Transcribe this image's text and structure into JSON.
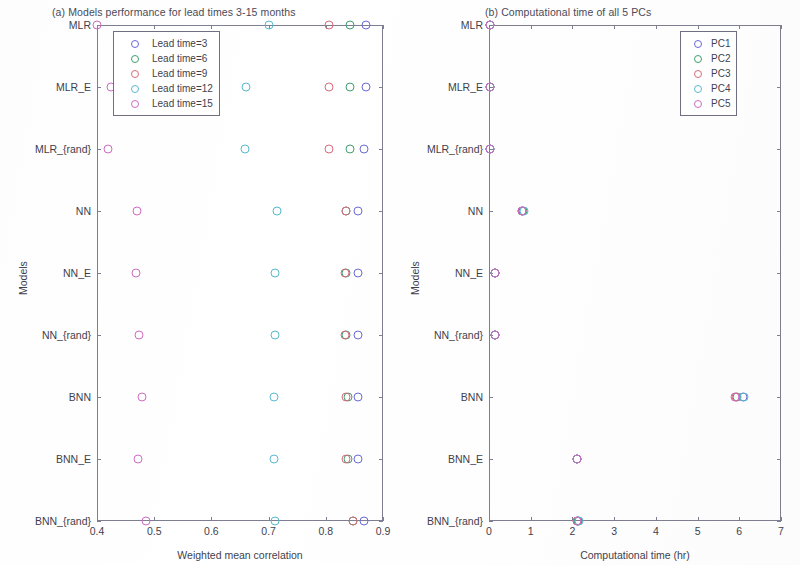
{
  "figure": {
    "models": [
      "MLR",
      "MLR_E",
      "MLR_{rand}",
      "NN",
      "NN_E",
      "NN_{rand}",
      "BNN",
      "BNN_E",
      "BNN_{rand}"
    ],
    "series_colors": [
      "#6a6ad8",
      "#3f9f6f",
      "#d86a7a",
      "#58b9cf",
      "#cf6ac4"
    ]
  },
  "panel_a": {
    "title": "(a) Models performance for lead times 3-15 months",
    "xlabel": "Weighted mean correlation",
    "ylabel": "Models",
    "xticks": [
      "0.4",
      "0.5",
      "0.6",
      "0.7",
      "0.8",
      "0.9"
    ],
    "legend": [
      {
        "label": "Lead time=3",
        "color": "#6a6ad8"
      },
      {
        "label": "Lead time=6",
        "color": "#3f9f6f"
      },
      {
        "label": "Lead time=9",
        "color": "#d86a7a"
      },
      {
        "label": "Lead time=12",
        "color": "#58b9cf"
      },
      {
        "label": "Lead time=15",
        "color": "#cf6ac4"
      }
    ]
  },
  "panel_b": {
    "title": "(b) Computational time of all 5 PCs",
    "xlabel": "Computational time (hr)",
    "ylabel": "Models",
    "xticks": [
      "0",
      "1",
      "2",
      "3",
      "4",
      "5",
      "6",
      "7"
    ],
    "legend": [
      {
        "label": "PC1",
        "color": "#6a6ad8"
      },
      {
        "label": "PC2",
        "color": "#3f9f6f"
      },
      {
        "label": "PC3",
        "color": "#d86a7a"
      },
      {
        "label": "PC4",
        "color": "#58b9cf"
      },
      {
        "label": "PC5",
        "color": "#cf6ac4"
      }
    ]
  },
  "chart_data": [
    {
      "type": "scatter",
      "panel": "a",
      "title": "(a) Models performance for lead times 3-15 months",
      "xlabel": "Weighted mean correlation",
      "ylabel": "Models",
      "xlim": [
        0.4,
        0.9
      ],
      "ylim_categories": [
        "MLR",
        "MLR_E",
        "MLR_{rand}",
        "NN",
        "NN_E",
        "NN_{rand}",
        "BNN",
        "BNN_E",
        "BNN_{rand}"
      ],
      "xticks": [
        0.4,
        0.5,
        0.6,
        0.7,
        0.8,
        0.9
      ],
      "grid": false,
      "legend_position": "upper left inside",
      "categories": [
        "MLR",
        "MLR_E",
        "MLR_{rand}",
        "NN",
        "NN_E",
        "NN_{rand}",
        "BNN",
        "BNN_E",
        "BNN_{rand}"
      ],
      "series": [
        {
          "name": "Lead time=3",
          "color": "#6a6ad8",
          "values": [
            0.87,
            0.87,
            0.866,
            0.856,
            0.856,
            0.856,
            0.856,
            0.856,
            0.866
          ]
        },
        {
          "name": "Lead time=6",
          "color": "#3f9f6f",
          "values": [
            0.842,
            0.842,
            0.842,
            0.836,
            0.836,
            0.836,
            0.838,
            0.838,
            0.848
          ]
        },
        {
          "name": "Lead time=9",
          "color": "#d86a7a",
          "values": [
            0.806,
            0.806,
            0.806,
            0.836,
            0.834,
            0.834,
            0.836,
            0.836,
            0.848
          ]
        },
        {
          "name": "Lead time=12",
          "color": "#58b9cf",
          "values": [
            0.7,
            0.66,
            0.658,
            0.715,
            0.712,
            0.712,
            0.71,
            0.71,
            0.712
          ]
        },
        {
          "name": "Lead time=15",
          "color": "#cf6ac4",
          "values": [
            0.4,
            0.424,
            0.42,
            0.47,
            0.468,
            0.474,
            0.478,
            0.472,
            0.486
          ]
        }
      ]
    },
    {
      "type": "scatter",
      "panel": "b",
      "title": "(b) Computational time of all 5 PCs",
      "xlabel": "Computational time (hr)",
      "ylabel": "Models",
      "xlim": [
        0,
        7
      ],
      "ylim_categories": [
        "MLR",
        "MLR_E",
        "MLR_{rand}",
        "NN",
        "NN_E",
        "NN_{rand}",
        "BNN",
        "BNN_E",
        "BNN_{rand}"
      ],
      "xticks": [
        0,
        1,
        2,
        3,
        4,
        5,
        6,
        7
      ],
      "grid": false,
      "legend_position": "upper right inside",
      "categories": [
        "MLR",
        "MLR_E",
        "MLR_{rand}",
        "NN",
        "NN_E",
        "NN_{rand}",
        "BNN",
        "BNN_E",
        "BNN_{rand}"
      ],
      "series": [
        {
          "name": "PC1",
          "color": "#6a6ad8",
          "values": [
            0.02,
            0.02,
            0.02,
            0.8,
            0.14,
            0.14,
            6.1,
            2.12,
            2.14
          ]
        },
        {
          "name": "PC2",
          "color": "#3f9f6f",
          "values": [
            0.02,
            0.02,
            0.02,
            0.82,
            0.14,
            0.14,
            5.95,
            2.12,
            2.14
          ]
        },
        {
          "name": "PC3",
          "color": "#d86a7a",
          "values": [
            0.02,
            0.02,
            0.02,
            0.8,
            0.14,
            0.14,
            5.92,
            2.1,
            2.12
          ]
        },
        {
          "name": "PC4",
          "color": "#58b9cf",
          "values": [
            0.02,
            0.02,
            0.02,
            0.84,
            0.14,
            0.14,
            6.12,
            2.12,
            2.16
          ]
        },
        {
          "name": "PC5",
          "color": "#cf6ac4",
          "values": [
            0.02,
            0.02,
            0.02,
            0.8,
            0.14,
            0.14,
            5.9,
            2.1,
            2.12
          ]
        }
      ]
    }
  ]
}
